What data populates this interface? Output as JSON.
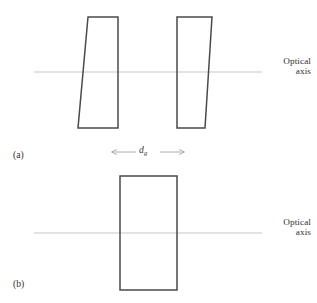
{
  "figure": {
    "background_color": "#ffffff",
    "stroke_color": "#4a4a4a",
    "axis_color": "#b9b9b9",
    "text_color": "#2f2f2f",
    "width": 317,
    "height": 303
  },
  "panels": [
    {
      "id": "a",
      "caption": "(a)",
      "description": "two tilted wedge prisms separated by an air gap",
      "optical_axis": {
        "label_line_1": "Optical",
        "label_line_2": "axis",
        "y": 72,
        "x_start": 34,
        "x_end": 262
      },
      "shapes": [
        {
          "name": "left-wedge-prism",
          "points": "88,17 118,17 118,128 78,128"
        },
        {
          "name": "right-wedge-prism",
          "points": "177,17 212,17 205,128 177,128"
        }
      ]
    },
    {
      "id": "b",
      "caption": "(b)",
      "description": "single rectangular plate",
      "optical_axis": {
        "label_line_1": "Optical",
        "label_line_2": "axis",
        "y": 233,
        "x_start": 34,
        "x_end": 262
      },
      "shapes": [
        {
          "name": "rectangular-plate",
          "points": "120,176 177,176 177,290 120,290"
        }
      ]
    }
  ],
  "gap_dimension": {
    "symbol": "d",
    "subscript": "g",
    "arrow_y": 152,
    "arrow_x_start": 110,
    "arrow_x_end": 185
  }
}
